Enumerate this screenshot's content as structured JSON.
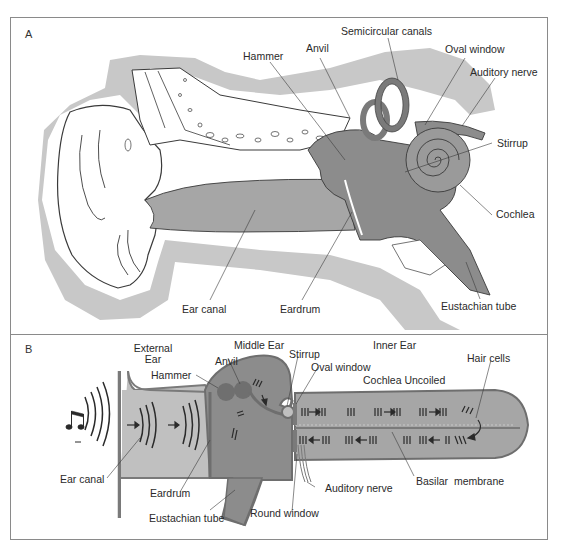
{
  "figure": {
    "panels": [
      {
        "id": "A",
        "title": "Cross-section of the ear",
        "labels": {
          "hammer": "Hammer",
          "anvil": "Anvil",
          "semicircular_canals": "Semicircular canals",
          "oval_window": "Oval window",
          "auditory_nerve": "Auditory nerve",
          "stirrup": "Stirrup",
          "cochlea": "Cochlea",
          "ear_canal": "Ear canal",
          "eardrum": "Eardrum",
          "eustachian_tube": "Eustachian tube"
        }
      },
      {
        "id": "B",
        "title": "Schematic with cochlea uncoiled",
        "labels": {
          "external_ear_1": "External",
          "external_ear_2": "Ear",
          "middle_ear": "Middle Ear",
          "inner_ear": "Inner Ear",
          "anvil": "Anvil",
          "hammer": "Hammer",
          "stirrup": "Stirrup",
          "oval_window": "Oval window",
          "cochlea_uncoiled": "Cochlea Uncoiled",
          "hair_cells": "Hair cells",
          "ear_canal": "Ear canal",
          "eardrum": "Eardrum",
          "eustachian_tube": "Eustachian tube",
          "round_window": "Round window",
          "auditory_nerve": "Auditory nerve",
          "basilar_membrane": "Basilar  membrane"
        }
      }
    ],
    "colors": {
      "tissue_dark": "#8c8c8c",
      "tissue_mid": "#a6a6a6",
      "skull_shadow": "#c8c8c8",
      "outline": "#3a3a3a",
      "border": "#8a8a8a"
    },
    "icons": {
      "sound_source": "music-note-icon"
    }
  }
}
